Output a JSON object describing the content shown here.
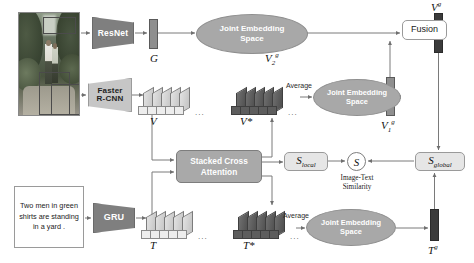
{
  "diagram": {
    "image_input": {
      "name": "input-image",
      "alt": "Photograph of two men standing in a yard with object bounding boxes"
    },
    "caption_input": {
      "text": "Two men in green shirts are standing in a yard ."
    },
    "encoders": {
      "resnet": "ResNet",
      "faster_rcnn": "Faster\nR-CNN",
      "faster_rcnn_line1": "Faster",
      "faster_rcnn_line2": "R-CNN",
      "gru": "GRU"
    },
    "embedding_spaces": {
      "jes_top": "Joint Embedding Space",
      "jes_top_line1": "Joint Embedding",
      "jes_top_line2": "Space",
      "jes_mid": "Joint Embedding Space",
      "jes_mid_line1": "Joint Embedding",
      "jes_mid_line2": "Space",
      "jes_bottom": "Joint Embedding Space",
      "jes_bottom_line1": "Joint Embedding",
      "jes_bottom_line2": "Space"
    },
    "blocks": {
      "stacked_cross_attention_line1": "Stacked Cross",
      "stacked_cross_attention_line2": "Attention",
      "fusion": "Fusion",
      "similarity_symbol": "S",
      "similarity_caption_line1": "Image-Text",
      "similarity_caption_line2": "Similarity"
    },
    "tensor_labels": {
      "global_image": "G",
      "region_features": "V",
      "attended_regions": "V*",
      "v2_global": "V",
      "v2_global_sub": "2",
      "v2_global_sup": "g",
      "v1_global": "V",
      "v1_global_sub": "1",
      "v1_global_sup": "g",
      "v_global": "V",
      "v_global_sup": "g",
      "word_features": "T",
      "attended_words": "T*",
      "t_global": "T",
      "t_global_sup": "g",
      "s_local": "S",
      "s_local_sub": "local",
      "s_global": "S",
      "s_global_sub": "global"
    },
    "edge_labels": {
      "average_top": "Average",
      "average_bottom": "Average"
    },
    "ellipsis": "...",
    "colors": {
      "dark_bar": "#3b3b3b",
      "mid_bar": "#8f8f8f",
      "ellipse_fill": "#a8a8a8",
      "block_fill": "#a9a9a9",
      "trapezoid_fill": "#7f7f7f",
      "line": "#7a7a7a",
      "background": "#ffffff"
    }
  }
}
